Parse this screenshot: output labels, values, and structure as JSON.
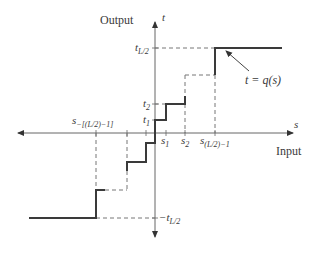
{
  "diagram": {
    "type": "quantizer-staircase",
    "axes": {
      "vertical_title": "Output",
      "vertical_var": "t",
      "horizontal_title": "Input",
      "horizontal_var": "s"
    },
    "y_ticks": {
      "t_top": {
        "base": "t",
        "sub": "L/2"
      },
      "t2": {
        "base": "t",
        "sub": "2"
      },
      "t1": {
        "base": "t",
        "sub": "1"
      },
      "t_bottom": {
        "base": "−t",
        "sub": "L/2"
      }
    },
    "x_ticks": {
      "s1": {
        "base": "s",
        "sub": "1"
      },
      "s2": {
        "base": "s",
        "sub": "2"
      },
      "s_last": {
        "base": "s",
        "sub": "(L/2)−1"
      },
      "s_neg": {
        "base": "s",
        "sub": "−[(L/2)−1]"
      }
    },
    "annotation": "t = q(s)",
    "colors": {
      "axis": "#555555",
      "curve": "#3a3a3a",
      "dashed": "#777777"
    }
  }
}
